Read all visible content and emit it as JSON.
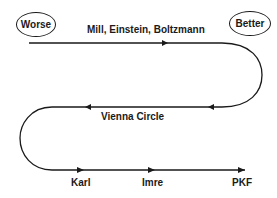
{
  "diagram": {
    "endpoints": {
      "worse": "Worse",
      "better": "Better"
    },
    "labels": {
      "top": "Mill, Einstein, Boltzmann",
      "middle": "Vienna Circle",
      "bottom": [
        "Karl",
        "Imre",
        "PKF"
      ]
    },
    "colors": {
      "stroke": "#1a1a1a",
      "background": "#ffffff"
    }
  }
}
